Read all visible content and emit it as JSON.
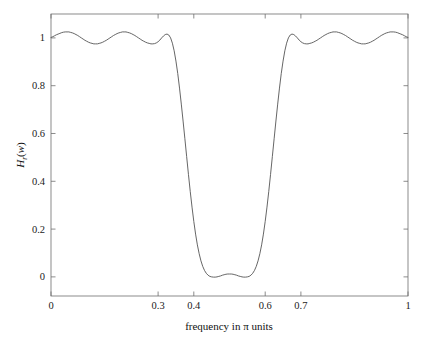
{
  "figure": {
    "background_color": "#ffffff",
    "axes_color": "#6e6e6e",
    "line_color": "#555555"
  },
  "chart_data": {
    "type": "line",
    "title": "",
    "xlabel": "frequency in π units",
    "ylabel": "Hr(w)",
    "ylabel_parts": {
      "main": "H",
      "subscript": "r",
      "open_paren": "(",
      "arg": "w",
      "close_paren": ")"
    },
    "xlim": [
      0,
      1
    ],
    "ylim": [
      -0.08,
      1.1
    ],
    "grid": false,
    "legend": null,
    "xticks": [
      0,
      0.3,
      0.4,
      0.6,
      0.7,
      1
    ],
    "xticklabels": [
      "0",
      "0.3",
      "0.4",
      "0.6",
      "0.7",
      "1"
    ],
    "yticks": [
      0,
      0.2,
      0.4,
      0.6,
      0.8,
      1
    ],
    "yticklabels": [
      "0",
      "0.2",
      "0.4",
      "0.6",
      "0.8",
      "1"
    ],
    "annotations": [],
    "series": [
      {
        "name": "amplitude response",
        "color": "#555555",
        "linewidth": 0.9,
        "x": [
          0.0,
          0.005,
          0.01,
          0.015,
          0.02,
          0.025,
          0.03,
          0.035,
          0.04,
          0.045,
          0.05,
          0.055,
          0.06,
          0.065,
          0.07,
          0.075,
          0.08,
          0.085,
          0.09,
          0.095,
          0.1,
          0.105,
          0.11,
          0.115,
          0.12,
          0.125,
          0.13,
          0.135,
          0.14,
          0.145,
          0.15,
          0.155,
          0.16,
          0.165,
          0.17,
          0.175,
          0.18,
          0.185,
          0.19,
          0.195,
          0.2,
          0.205,
          0.21,
          0.215,
          0.22,
          0.225,
          0.23,
          0.235,
          0.24,
          0.245,
          0.25,
          0.255,
          0.26,
          0.265,
          0.27,
          0.275,
          0.28,
          0.285,
          0.29,
          0.295,
          0.3,
          0.305,
          0.31,
          0.315,
          0.32,
          0.325,
          0.33,
          0.335,
          0.34,
          0.345,
          0.35,
          0.355,
          0.36,
          0.365,
          0.37,
          0.375,
          0.38,
          0.385,
          0.39,
          0.395,
          0.4,
          0.405,
          0.41,
          0.415,
          0.42,
          0.425,
          0.43,
          0.435,
          0.44,
          0.445,
          0.45,
          0.455,
          0.46,
          0.465,
          0.47,
          0.475,
          0.48,
          0.485,
          0.49,
          0.495,
          0.5,
          0.505,
          0.51,
          0.515,
          0.52,
          0.525,
          0.53,
          0.535,
          0.54,
          0.545,
          0.55,
          0.555,
          0.56,
          0.565,
          0.57,
          0.575,
          0.58,
          0.585,
          0.59,
          0.595,
          0.6,
          0.605,
          0.61,
          0.615,
          0.62,
          0.625,
          0.63,
          0.635,
          0.64,
          0.645,
          0.65,
          0.655,
          0.66,
          0.665,
          0.67,
          0.675,
          0.68,
          0.685,
          0.69,
          0.695,
          0.7,
          0.705,
          0.71,
          0.715,
          0.72,
          0.725,
          0.73,
          0.735,
          0.74,
          0.745,
          0.75,
          0.755,
          0.76,
          0.765,
          0.77,
          0.775,
          0.78,
          0.785,
          0.79,
          0.795,
          0.8,
          0.805,
          0.81,
          0.815,
          0.82,
          0.825,
          0.83,
          0.835,
          0.84,
          0.845,
          0.85,
          0.855,
          0.86,
          0.865,
          0.87,
          0.875,
          0.88,
          0.885,
          0.89,
          0.895,
          0.9,
          0.905,
          0.91,
          0.915,
          0.92,
          0.925,
          0.93,
          0.935,
          0.94,
          0.945,
          0.95,
          0.955,
          0.96,
          0.965,
          0.97,
          0.975,
          0.98,
          0.985,
          0.99,
          0.995,
          1.0
        ],
        "y": [
          1.002,
          1.005,
          1.009,
          1.013,
          1.016,
          1.019,
          1.022,
          1.024,
          1.025,
          1.025,
          1.025,
          1.023,
          1.021,
          1.018,
          1.014,
          1.01,
          1.005,
          1.0,
          0.995,
          0.99,
          0.986,
          0.982,
          0.979,
          0.977,
          0.975,
          0.975,
          0.975,
          0.977,
          0.979,
          0.982,
          0.986,
          0.99,
          0.995,
          1.0,
          1.005,
          1.01,
          1.014,
          1.018,
          1.021,
          1.023,
          1.025,
          1.025,
          1.025,
          1.023,
          1.021,
          1.018,
          1.014,
          1.01,
          1.005,
          1.0,
          0.995,
          0.99,
          0.986,
          0.982,
          0.979,
          0.977,
          0.975,
          0.975,
          0.976,
          0.979,
          0.984,
          0.991,
          1.0,
          1.008,
          1.014,
          1.016,
          1.012,
          1.0,
          0.978,
          0.946,
          0.903,
          0.851,
          0.79,
          0.723,
          0.652,
          0.578,
          0.503,
          0.429,
          0.358,
          0.292,
          0.232,
          0.179,
          0.134,
          0.097,
          0.067,
          0.044,
          0.027,
          0.015,
          0.007,
          0.002,
          0.0,
          -0.001,
          -0.001,
          0.0,
          0.002,
          0.004,
          0.007,
          0.009,
          0.011,
          0.012,
          0.012,
          0.012,
          0.011,
          0.009,
          0.007,
          0.004,
          0.002,
          0.0,
          -0.001,
          -0.001,
          0.0,
          0.002,
          0.007,
          0.015,
          0.027,
          0.044,
          0.067,
          0.097,
          0.134,
          0.179,
          0.232,
          0.292,
          0.358,
          0.429,
          0.503,
          0.578,
          0.652,
          0.723,
          0.79,
          0.851,
          0.903,
          0.946,
          0.978,
          1.0,
          1.012,
          1.016,
          1.014,
          1.008,
          1.0,
          0.991,
          0.984,
          0.979,
          0.976,
          0.975,
          0.975,
          0.977,
          0.979,
          0.982,
          0.986,
          0.99,
          0.995,
          1.0,
          1.005,
          1.01,
          1.014,
          1.018,
          1.021,
          1.023,
          1.025,
          1.025,
          1.025,
          1.023,
          1.021,
          1.018,
          1.014,
          1.01,
          1.005,
          1.0,
          0.995,
          0.99,
          0.986,
          0.982,
          0.979,
          0.977,
          0.975,
          0.975,
          0.975,
          0.977,
          0.979,
          0.982,
          0.986,
          0.99,
          0.995,
          1.0,
          1.005,
          1.01,
          1.014,
          1.018,
          1.021,
          1.023,
          1.025,
          1.025,
          1.025,
          1.024,
          1.022,
          1.019,
          1.016,
          1.013,
          1.009,
          1.005,
          1.002
        ]
      }
    ]
  }
}
